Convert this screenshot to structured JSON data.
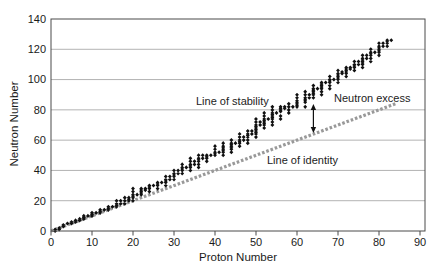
{
  "chart_data": {
    "type": "scatter",
    "title": "",
    "xlabel": "Proton Number",
    "ylabel": "Neutron Number",
    "xlim": [
      0,
      90
    ],
    "ylim": [
      0,
      140
    ],
    "x_ticks": [
      0,
      10,
      20,
      30,
      40,
      50,
      60,
      70,
      80,
      90
    ],
    "y_ticks": [
      0,
      20,
      40,
      60,
      80,
      100,
      120,
      140
    ],
    "grid": "horizontal",
    "legend": "none",
    "colors": {
      "marker": "#111111",
      "identity_line": "#999999",
      "gridline": "#b3b3b3",
      "frame": "#4a4a4a",
      "text": "#1a1a1a"
    },
    "series": [
      {
        "name": "Line of stability",
        "marker": "diamond",
        "color": "#111111",
        "points_format": "[proton_number, [neutron_numbers...]]",
        "points": [
          [
            1,
            [
              0,
              1
            ]
          ],
          [
            2,
            [
              1,
              2
            ]
          ],
          [
            3,
            [
              3,
              4
            ]
          ],
          [
            4,
            [
              5
            ]
          ],
          [
            5,
            [
              5,
              6
            ]
          ],
          [
            6,
            [
              6,
              7
            ]
          ],
          [
            7,
            [
              7,
              8
            ]
          ],
          [
            8,
            [
              8,
              9,
              10
            ]
          ],
          [
            9,
            [
              10
            ]
          ],
          [
            10,
            [
              10,
              11,
              12
            ]
          ],
          [
            11,
            [
              12
            ]
          ],
          [
            12,
            [
              12,
              13,
              14
            ]
          ],
          [
            13,
            [
              14
            ]
          ],
          [
            14,
            [
              14,
              15,
              16
            ]
          ],
          [
            15,
            [
              16
            ]
          ],
          [
            16,
            [
              16,
              17,
              18,
              20
            ]
          ],
          [
            17,
            [
              18,
              20
            ]
          ],
          [
            18,
            [
              18,
              20,
              22
            ]
          ],
          [
            19,
            [
              20,
              21,
              22
            ]
          ],
          [
            20,
            [
              20,
              22,
              23,
              24,
              26,
              28
            ]
          ],
          [
            21,
            [
              24
            ]
          ],
          [
            22,
            [
              24,
              25,
              26,
              27,
              28
            ]
          ],
          [
            23,
            [
              27,
              28
            ]
          ],
          [
            24,
            [
              26,
              28,
              29,
              30
            ]
          ],
          [
            25,
            [
              30
            ]
          ],
          [
            26,
            [
              28,
              30,
              31,
              32
            ]
          ],
          [
            27,
            [
              32
            ]
          ],
          [
            28,
            [
              30,
              32,
              33,
              34,
              36
            ]
          ],
          [
            29,
            [
              34,
              36
            ]
          ],
          [
            30,
            [
              34,
              36,
              37,
              38,
              40
            ]
          ],
          [
            31,
            [
              38,
              40
            ]
          ],
          [
            32,
            [
              38,
              40,
              41,
              42,
              44
            ]
          ],
          [
            33,
            [
              42
            ]
          ],
          [
            34,
            [
              40,
              42,
              43,
              44,
              46,
              48
            ]
          ],
          [
            35,
            [
              44,
              46
            ]
          ],
          [
            36,
            [
              42,
              44,
              46,
              47,
              48,
              50
            ]
          ],
          [
            37,
            [
              48,
              50
            ]
          ],
          [
            38,
            [
              46,
              48,
              49,
              50
            ]
          ],
          [
            39,
            [
              50
            ]
          ],
          [
            40,
            [
              50,
              51,
              52,
              54,
              56
            ]
          ],
          [
            41,
            [
              52
            ]
          ],
          [
            42,
            [
              50,
              52,
              53,
              54,
              55,
              56,
              58
            ]
          ],
          [
            44,
            [
              52,
              54,
              55,
              56,
              57,
              58,
              60
            ]
          ],
          [
            45,
            [
              58
            ]
          ],
          [
            46,
            [
              56,
              58,
              59,
              60,
              62,
              64
            ]
          ],
          [
            47,
            [
              60,
              62
            ]
          ],
          [
            48,
            [
              58,
              60,
              62,
              63,
              64,
              66
            ]
          ],
          [
            49,
            [
              64,
              66
            ]
          ],
          [
            50,
            [
              62,
              64,
              65,
              66,
              67,
              68,
              69,
              70,
              72,
              74
            ]
          ],
          [
            51,
            [
              70,
              72
            ]
          ],
          [
            52,
            [
              68,
              70,
              71,
              72,
              73,
              74,
              76,
              78
            ]
          ],
          [
            53,
            [
              74
            ]
          ],
          [
            54,
            [
              70,
              72,
              74,
              75,
              76,
              77,
              78,
              80,
              82
            ]
          ],
          [
            55,
            [
              78
            ]
          ],
          [
            56,
            [
              74,
              76,
              79,
              80,
              81,
              82
            ]
          ],
          [
            57,
            [
              81,
              82
            ]
          ],
          [
            58,
            [
              78,
              80,
              82,
              84
            ]
          ],
          [
            59,
            [
              82
            ]
          ],
          [
            60,
            [
              82,
              83,
              84,
              85,
              86,
              88,
              90
            ]
          ],
          [
            62,
            [
              82,
              85,
              86,
              87,
              88,
              90,
              92
            ]
          ],
          [
            63,
            [
              88,
              90
            ]
          ],
          [
            64,
            [
              88,
              90,
              91,
              92,
              93,
              94,
              96
            ]
          ],
          [
            65,
            [
              94
            ]
          ],
          [
            66,
            [
              90,
              92,
              94,
              95,
              96,
              97,
              98
            ]
          ],
          [
            67,
            [
              98
            ]
          ],
          [
            68,
            [
              94,
              96,
              98,
              99,
              100,
              102
            ]
          ],
          [
            69,
            [
              100
            ]
          ],
          [
            70,
            [
              98,
              100,
              101,
              102,
              103,
              104,
              106
            ]
          ],
          [
            71,
            [
              104,
              105
            ]
          ],
          [
            72,
            [
              102,
              104,
              105,
              106,
              107,
              108
            ]
          ],
          [
            73,
            [
              107,
              108
            ]
          ],
          [
            74,
            [
              106,
              108,
              109,
              110,
              112
            ]
          ],
          [
            75,
            [
              110,
              112
            ]
          ],
          [
            76,
            [
              108,
              110,
              111,
              112,
              113,
              114,
              116
            ]
          ],
          [
            77,
            [
              114,
              116
            ]
          ],
          [
            78,
            [
              112,
              114,
              116,
              117,
              118,
              120
            ]
          ],
          [
            79,
            [
              118
            ]
          ],
          [
            80,
            [
              116,
              118,
              119,
              120,
              121,
              122,
              124
            ]
          ],
          [
            81,
            [
              122,
              124
            ]
          ],
          [
            82,
            [
              122,
              124,
              125,
              126
            ]
          ],
          [
            83,
            [
              126
            ]
          ]
        ]
      },
      {
        "name": "Line of identity",
        "style": "dashed-squares",
        "color": "#999999",
        "line_from": [
          0,
          0
        ],
        "line_to": [
          84,
          84
        ]
      }
    ],
    "annotations": [
      {
        "text": "Line of stability"
      },
      {
        "text": "Neutron excess"
      },
      {
        "text": "Line of identity"
      },
      {
        "type": "double-headed-vertical-arrow",
        "x": 64,
        "n_from": 83.5,
        "n_to": 65
      }
    ]
  }
}
